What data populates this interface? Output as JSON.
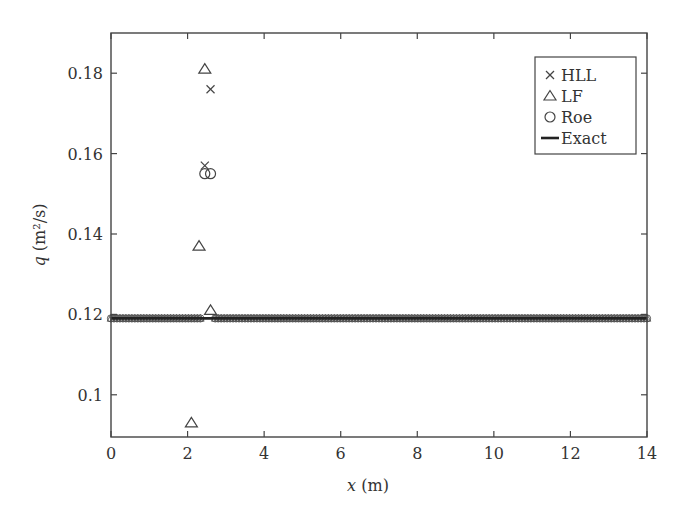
{
  "chart_data": {
    "type": "scatter",
    "title": "",
    "xlabel": "x (m)",
    "xlabel_var": "x",
    "xlabel_unit": " (m)",
    "ylabel": "q (m²/s)",
    "ylabel_var": "q",
    "ylabel_unit": " (m²/s)",
    "xlim": [
      0,
      14
    ],
    "ylim": [
      0.0895,
      0.19
    ],
    "xticks": [
      0,
      2,
      4,
      6,
      8,
      10,
      12,
      14
    ],
    "xtick_labels": [
      "0",
      "2",
      "4",
      "6",
      "8",
      "10",
      "12",
      "14"
    ],
    "yticks": [
      0.1,
      0.12,
      0.14,
      0.16,
      0.18
    ],
    "ytick_labels": [
      "0.1",
      "0.12",
      "0.14",
      "0.16",
      "0.18"
    ],
    "grid": false,
    "legend_position": "upper right",
    "baseline_q": 0.119,
    "series": [
      {
        "name": "HLL",
        "marker": "x",
        "points": [
          [
            2.45,
            0.157
          ],
          [
            2.6,
            0.176
          ]
        ],
        "note": "plus dense points along q≈0.119 across 0–14 m"
      },
      {
        "name": "LF",
        "marker": "triangle",
        "points": [
          [
            2.1,
            0.093
          ],
          [
            2.3,
            0.137
          ],
          [
            2.45,
            0.181
          ],
          [
            2.6,
            0.121
          ]
        ],
        "note": "plus dense points along q≈0.119 across 0–14 m"
      },
      {
        "name": "Roe",
        "marker": "circle",
        "points": [
          [
            2.45,
            0.155
          ],
          [
            2.6,
            0.155
          ]
        ],
        "note": "plus dense points along q≈0.119 across 0–14 m"
      },
      {
        "name": "Exact",
        "marker": "line",
        "points": [
          [
            0,
            0.119
          ],
          [
            14,
            0.119
          ]
        ]
      }
    ]
  },
  "legend": {
    "items": [
      {
        "symbol": "×",
        "label": "HLL"
      },
      {
        "symbol": "△",
        "label": "LF"
      },
      {
        "symbol": "○",
        "label": "Roe"
      },
      {
        "symbol": "—",
        "label": "Exact"
      }
    ]
  }
}
